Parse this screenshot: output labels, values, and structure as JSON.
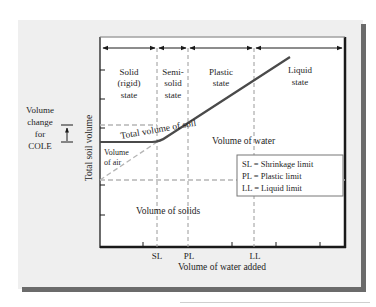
{
  "figure": {
    "y_axis_label": "Total soil volume",
    "x_axis_label": "Volume of water added",
    "x_tick_labels": [
      "SL",
      "PL",
      "LL"
    ],
    "states": [
      {
        "lines": [
          "Solid",
          "(rigid)",
          "state"
        ]
      },
      {
        "lines": [
          "Semi-",
          "solid",
          "state"
        ]
      },
      {
        "lines": [
          "Plastic",
          "state"
        ]
      },
      {
        "lines": [
          "Liquid",
          "state"
        ]
      }
    ],
    "curve_label": "Total volume of soil",
    "regions": {
      "water": "Volume of water",
      "air_line1": "Volume",
      "air_line2": "of air",
      "solids": "Volume of solids"
    },
    "cole_annotation": [
      "Volume",
      "change",
      "for",
      "COLE"
    ],
    "legend": [
      "SL = Shrinkage limit",
      "PL = Plastic limit",
      "LL = Liquid limit"
    ]
  },
  "colors": {
    "curve": "#4a4a4a",
    "dashed": "#b5b5b5",
    "frame": "#1a1a1a",
    "panel": "#efefef",
    "shadow": "#6b6b6b"
  }
}
